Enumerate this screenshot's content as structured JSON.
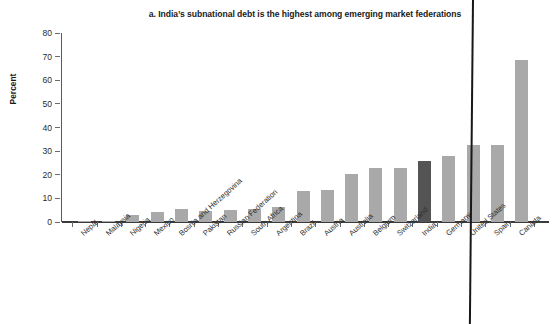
{
  "chart_data": {
    "type": "bar",
    "title": "a. India’s subnational debt is the highest among emerging market federations",
    "xlabel": "",
    "ylabel": "Percent",
    "ylim": [
      0,
      80
    ],
    "yticks": [
      0,
      10,
      20,
      30,
      40,
      50,
      60,
      70,
      80
    ],
    "grid": false,
    "legend": null,
    "categories": [
      "Nepal",
      "Malaysia",
      "Nigeria",
      "Mexico",
      "Bosnia and Herzegovina",
      "Pakistan",
      "Russian Federation",
      "South Africa",
      "Argentina",
      "Brazil",
      "Austria",
      "Australia",
      "Belgium",
      "Switzerland",
      "India",
      "Germany",
      "United States",
      "Spain",
      "Canada"
    ],
    "values": [
      0.3,
      0.5,
      3.0,
      4.3,
      5.5,
      4.6,
      5.0,
      5.5,
      6.3,
      13.0,
      13.6,
      20.5,
      23.0,
      23.0,
      25.8,
      28.0,
      32.5,
      32.5,
      68.5
    ],
    "highlight_category": "India",
    "colors": {
      "bar": "#a9a9a9",
      "highlight_bar": "#545454",
      "axis": "#3b3b3b",
      "text": "#231f20",
      "background": "#ffffff"
    }
  }
}
